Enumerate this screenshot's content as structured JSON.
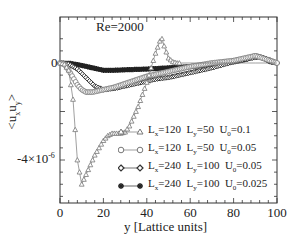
{
  "chart_data": {
    "type": "line",
    "title": "",
    "annotation": "Re=2000",
    "xlabel": "y [Lattice units]",
    "ylabel": "<u_x u_y>",
    "xlim": [
      0,
      100
    ],
    "ylim": [
      -5.9e-06,
      1.3e-06
    ],
    "xticks": [
      0,
      20,
      40,
      60,
      80,
      100
    ],
    "xtick_labels": [
      "0",
      "20",
      "40",
      "60",
      "80",
      "100"
    ],
    "yticks": [
      0,
      -4e-06
    ],
    "ytick_labels": [
      "0",
      "-4×10⁻⁶"
    ],
    "grid": false,
    "legend_position": "lower right (inside)",
    "series": [
      {
        "name": "Lx=120 Ly=50 U0=0.1",
        "marker": "triangle",
        "x": [
          0,
          2,
          4,
          6,
          8,
          10,
          12,
          14,
          16,
          18,
          20,
          22,
          24,
          26,
          28,
          30,
          32,
          34,
          36,
          38,
          40,
          42,
          44,
          46,
          47,
          48,
          50,
          52,
          54,
          56,
          60,
          70,
          80,
          90,
          100
        ],
        "y": [
          0,
          -5e-08,
          -3e-07,
          -1.5e-06,
          -4e-06,
          -5e-06,
          -4.6e-06,
          -4.2e-06,
          -3.8e-06,
          -3.5e-06,
          -3.2e-06,
          -3e-06,
          -2.9e-06,
          -2.9e-06,
          -2.9e-06,
          -2.85e-06,
          -2.6e-06,
          -2.2e-06,
          -1.8e-06,
          -1.3e-06,
          -8e-07,
          -2e-07,
          4e-07,
          9e-07,
          1e-06,
          7e-07,
          2e-07,
          5e-08,
          0,
          0,
          0,
          0,
          0,
          0,
          0
        ]
      },
      {
        "name": "Lx=120 Ly=50 U0=0.05",
        "marker": "circle",
        "x": [
          0,
          2,
          4,
          6,
          8,
          10,
          12,
          15,
          20,
          25,
          30,
          35,
          40,
          45,
          50,
          60,
          70,
          80,
          90,
          100
        ],
        "y": [
          0,
          -5e-08,
          -3e-07,
          -6e-07,
          -9e-07,
          -1.1e-06,
          -1.2e-06,
          -1.2e-06,
          -1.1e-06,
          -1e-06,
          -8.5e-07,
          -7e-07,
          -5.5e-07,
          -4.5e-07,
          -3.5e-07,
          -1.5e-07,
          0,
          1e-07,
          3e-07,
          0
        ]
      },
      {
        "name": "Lx=240 Ly=100 U0=0.05",
        "marker": "diamond",
        "x": [
          0,
          4,
          8,
          12,
          16,
          20,
          25,
          30,
          35,
          40,
          45,
          50,
          55,
          60,
          70,
          80,
          88,
          92,
          96,
          100
        ],
        "y": [
          0,
          -5e-08,
          -2.5e-07,
          -6e-07,
          -9.5e-07,
          -1.1e-06,
          -1.05e-06,
          -9.5e-07,
          -8.5e-07,
          -7.5e-07,
          -6.5e-07,
          -6e-07,
          -5e-07,
          -4e-07,
          -2e-07,
          5e-08,
          2e-07,
          2.5e-07,
          1.5e-07,
          0
        ]
      },
      {
        "name": "Lx=240 Ly=100 U0=0.025",
        "marker": "star",
        "x": [
          0,
          5,
          10,
          15,
          20,
          25,
          30,
          40,
          50,
          60,
          70,
          80,
          86,
          90,
          94,
          97,
          100
        ],
        "y": [
          0,
          -2e-08,
          -1e-07,
          -2e-07,
          -3e-07,
          -3e-07,
          -2.8e-07,
          -2.5e-07,
          -2e-07,
          -1.5e-07,
          -5e-08,
          5e-08,
          1.5e-07,
          3e-07,
          2e-07,
          5e-08,
          0
        ]
      }
    ]
  },
  "labels": {
    "annotation": "Re=2000",
    "ylabel": "<u_x u_y>",
    "xlabel": "y [Lattice units]",
    "ytick_zero": "0",
    "ytick_neg": "-4×10",
    "ytick_neg_exp": "-6"
  },
  "legend": [
    {
      "marker": "triangle",
      "lx": "=120",
      "ly": "=50",
      "u0": "=0.1"
    },
    {
      "marker": "circle",
      "lx": "=120",
      "ly": "=50",
      "u0": "=0.05"
    },
    {
      "marker": "diamond",
      "lx": "=240",
      "ly": "=100",
      "u0": "=0.05"
    },
    {
      "marker": "star",
      "lx": "=240",
      "ly": "=100",
      "u0": "=0.025"
    }
  ],
  "colors": {
    "axis": "#333333",
    "triangle": "#777777",
    "circle": "#777777",
    "diamond": "#333333",
    "star": "#222222"
  }
}
